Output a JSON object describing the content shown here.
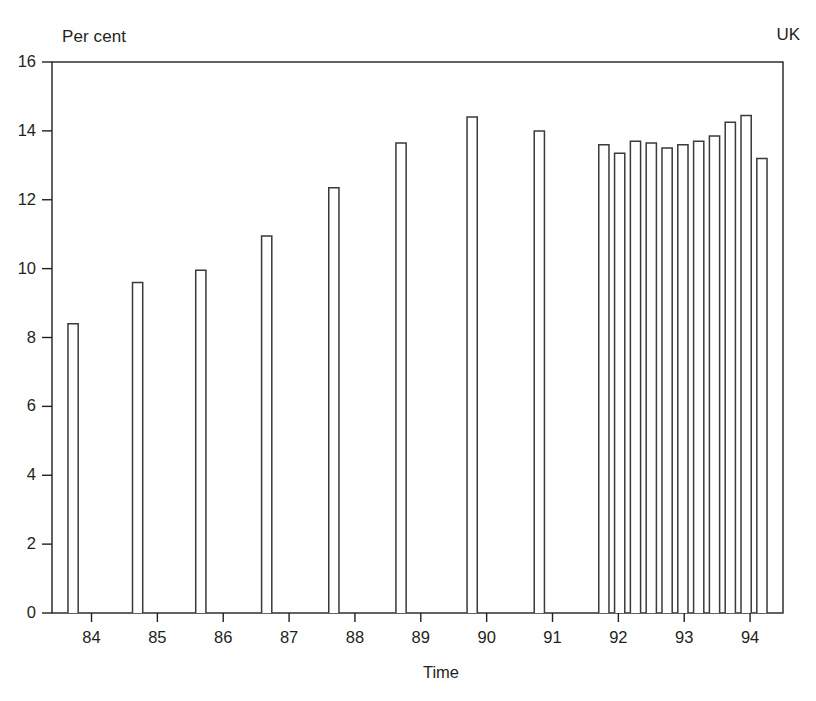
{
  "chart_data": {
    "type": "bar",
    "title": "",
    "subtitle": "",
    "region_label": "UK",
    "units_label": "Per cent",
    "xlabel": "Time",
    "ylabel": "",
    "ylim": [
      0,
      16
    ],
    "ytick_labels": [
      "0",
      "2",
      "4",
      "6",
      "8",
      "10",
      "12",
      "14",
      "16"
    ],
    "ytick_values": [
      0,
      2,
      4,
      6,
      8,
      10,
      12,
      14,
      16
    ],
    "xtick_labels": [
      "84",
      "85",
      "86",
      "87",
      "88",
      "89",
      "90",
      "91",
      "92",
      "93",
      "94"
    ],
    "xtick_values": [
      1984,
      1985,
      1986,
      1987,
      1988,
      1989,
      1990,
      1991,
      1992,
      1993,
      1994
    ],
    "grid": false,
    "legend": "none",
    "bar_style": "outline",
    "bar_fill": "#ffffff",
    "bar_stroke": "#3a3a3a",
    "axis_color": "#231f20",
    "categories": [
      "1984",
      "1985",
      "1986",
      "1987",
      "1988",
      "1989",
      "1990",
      "1991",
      "1992 Q1",
      "1992 Q2",
      "1992 Q3",
      "1992 Q4",
      "1993 Q1",
      "1993 Q2",
      "1993 Q3",
      "1993 Q4",
      "1994 Q1",
      "1994 Q2",
      "1994 Q3"
    ],
    "values": [
      8.4,
      9.6,
      9.95,
      10.95,
      12.35,
      13.65,
      14.4,
      14.0,
      13.6,
      13.35,
      13.7,
      13.65,
      13.5,
      13.6,
      13.7,
      13.85,
      14.25,
      14.45,
      13.2
    ],
    "x_positions": [
      1983.72,
      1984.7,
      1985.66,
      1986.66,
      1987.68,
      1988.7,
      1989.78,
      1990.8,
      1991.78,
      1992.02,
      1992.26,
      1992.5,
      1992.74,
      1992.98,
      1993.22,
      1993.46,
      1993.7,
      1993.94,
      1994.18
    ],
    "bar_width_years": 0.155,
    "xlim": [
      1983.4,
      1994.5
    ]
  }
}
